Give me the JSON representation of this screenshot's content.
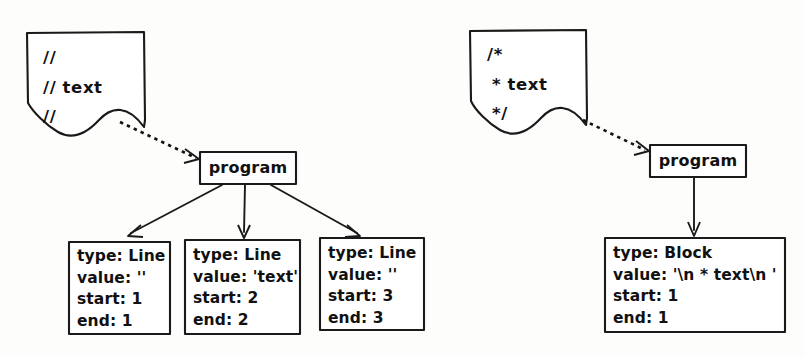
{
  "diagram": {
    "ink_color": "#1a1a1a",
    "paper_color": "#fdfdfb",
    "examples": [
      {
        "id": "line-comments",
        "source_document": {
          "name": "line-comment-source",
          "lines": [
            "//",
            "// text",
            "//"
          ]
        },
        "program_node": {
          "label": "program"
        },
        "edge_from_source": {
          "style": "dashed",
          "label": ""
        },
        "children": [
          {
            "name": "line-node-1",
            "fields": [
              {
                "key": "type",
                "value": "Line",
                "text": "type: Line"
              },
              {
                "key": "value",
                "value": "''",
                "text": "value: ''"
              },
              {
                "key": "start",
                "value": "1",
                "text": "start: 1"
              },
              {
                "key": "end",
                "value": "1",
                "text": "end: 1"
              }
            ]
          },
          {
            "name": "line-node-2",
            "fields": [
              {
                "key": "type",
                "value": "Line",
                "text": "type: Line"
              },
              {
                "key": "value",
                "value": "'text'",
                "text": "value: 'text'"
              },
              {
                "key": "start",
                "value": "2",
                "text": "start: 2"
              },
              {
                "key": "end",
                "value": "2",
                "text": "end: 2"
              }
            ]
          },
          {
            "name": "line-node-3",
            "fields": [
              {
                "key": "type",
                "value": "Line",
                "text": "type: Line"
              },
              {
                "key": "value",
                "value": "''",
                "text": "value: ''"
              },
              {
                "key": "start",
                "value": "3",
                "text": "start: 3"
              },
              {
                "key": "end",
                "value": "3",
                "text": "end: 3"
              }
            ]
          }
        ]
      },
      {
        "id": "block-comment",
        "source_document": {
          "name": "block-comment-source",
          "lines": [
            "/*",
            "* text",
            "*/"
          ]
        },
        "program_node": {
          "label": "program"
        },
        "edge_from_source": {
          "style": "dashed",
          "label": ""
        },
        "children": [
          {
            "name": "block-node-1",
            "fields": [
              {
                "key": "type",
                "value": "Block",
                "text": "type: Block"
              },
              {
                "key": "value",
                "value": "'\\n * text\\n '",
                "text": "value: '\\n * text\\n '"
              },
              {
                "key": "start",
                "value": "1",
                "text": "start: 1"
              },
              {
                "key": "end",
                "value": "1",
                "text": "end: 1"
              }
            ]
          }
        ]
      }
    ]
  }
}
